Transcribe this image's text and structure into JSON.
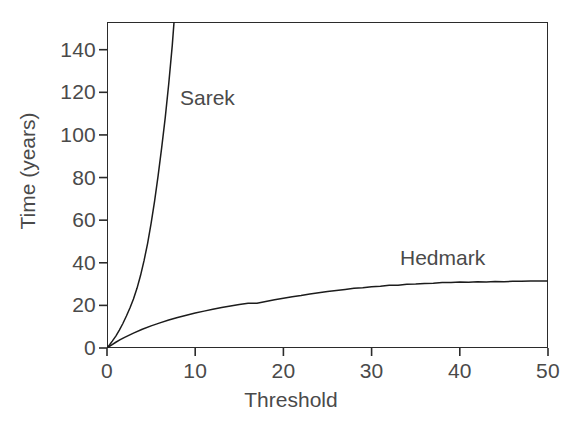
{
  "chart_data": {
    "type": "line",
    "title": "",
    "subtitle": "",
    "xlabel": "Threshold",
    "ylabel": "Time (years)",
    "xlim": [
      0,
      50
    ],
    "ylim": [
      0,
      153
    ],
    "xticks": [
      0,
      10,
      20,
      30,
      40,
      50
    ],
    "xtick_labels": [
      "0",
      "10",
      "20",
      "30",
      "40",
      "50"
    ],
    "yticks": [
      0,
      20,
      40,
      60,
      80,
      100,
      120,
      140
    ],
    "ytick_labels": [
      "0",
      "20",
      "40",
      "60",
      "80",
      "100",
      "120",
      "140"
    ],
    "grid": false,
    "legend_position": "inline-annotation",
    "frame": "box",
    "line_color": "#1c1c1c",
    "background_color": "#ffffff",
    "axis_color": "#2b2b2b",
    "text_color": "#4a4a4a",
    "series": [
      {
        "name": "Sarek",
        "label": "Sarek",
        "note": "steeply rising, exits top of axes near threshold 7.5",
        "x": [
          0.0,
          0.3,
          0.6,
          1.0,
          1.4,
          1.8,
          2.2,
          2.6,
          3.0,
          3.4,
          3.8,
          4.2,
          4.6,
          5.0,
          5.4,
          5.8,
          6.2,
          6.6,
          7.0,
          7.4,
          7.6
        ],
        "values": [
          0.0,
          1.5,
          3.2,
          5.6,
          8.4,
          11.5,
          15.0,
          18.8,
          23.0,
          28.0,
          34.0,
          41.0,
          49.0,
          58.5,
          69.0,
          81.0,
          94.0,
          108.0,
          124.0,
          142.0,
          153.0
        ]
      },
      {
        "name": "Hedmark",
        "label": "Hedmark",
        "note": "rises quickly then plateaus near 31 years",
        "x": [
          0.0,
          0.5,
          1.0,
          1.5,
          2.0,
          3.0,
          4.0,
          5.0,
          6.0,
          7.0,
          8.0,
          9.0,
          10.0,
          11.0,
          12.0,
          13.0,
          14.0,
          15.0,
          16.0,
          17.0,
          18.0,
          19.0,
          20.0,
          21.0,
          22.0,
          23.0,
          24.0,
          25.0,
          26.0,
          27.0,
          28.0,
          29.0,
          30.0,
          31.0,
          32.0,
          33.0,
          34.0,
          35.0,
          36.0,
          37.0,
          38.0,
          39.0,
          40.0,
          41.0,
          42.0,
          43.0,
          44.0,
          45.0,
          46.0,
          47.0,
          48.0,
          49.0,
          50.0
        ],
        "values": [
          0.0,
          1.4,
          2.7,
          3.9,
          5.0,
          7.0,
          8.8,
          10.4,
          11.8,
          13.1,
          14.3,
          15.4,
          16.4,
          17.3,
          18.2,
          19.0,
          19.7,
          20.4,
          21.0,
          21.0,
          21.8,
          22.6,
          23.3,
          24.0,
          24.6,
          25.3,
          25.9,
          26.5,
          27.0,
          27.5,
          28.0,
          28.3,
          28.8,
          29.0,
          29.4,
          29.5,
          29.9,
          30.0,
          30.3,
          30.4,
          30.7,
          30.7,
          31.0,
          30.9,
          31.1,
          31.0,
          31.2,
          31.1,
          31.3,
          31.3,
          31.4,
          31.4,
          31.5
        ]
      }
    ]
  }
}
